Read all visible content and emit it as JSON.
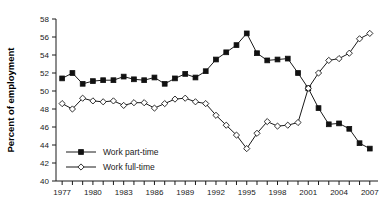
{
  "chart_data": {
    "type": "line",
    "title": "",
    "xlabel": "",
    "ylabel": "Percent of employment",
    "xlim": [
      1976.4,
      2007.8
    ],
    "ylim": [
      40,
      58
    ],
    "yticks": [
      40,
      42,
      44,
      46,
      48,
      50,
      52,
      54,
      56,
      58
    ],
    "xticks": [
      1977,
      1978,
      1979,
      1980,
      1981,
      1982,
      1983,
      1984,
      1985,
      1986,
      1987,
      1988,
      1989,
      1990,
      1991,
      1992,
      1993,
      1994,
      1995,
      1996,
      1997,
      1998,
      1999,
      2000,
      2001,
      2002,
      2003,
      2004,
      2005,
      2006,
      2007
    ],
    "xtick_labels": [
      "1977",
      "",
      "",
      "1980",
      "",
      "",
      "1983",
      "",
      "",
      "1986",
      "",
      "",
      "1989",
      "",
      "",
      "1992",
      "",
      "",
      "1995",
      "",
      "",
      "1998",
      "",
      "",
      "2001",
      "",
      "",
      "2004",
      "",
      "",
      "2007"
    ],
    "ytick_labels": [
      "40",
      "42",
      "44",
      "46",
      "48",
      "50",
      "52",
      "54",
      "56",
      "58"
    ],
    "grid": false,
    "legend_position": "lower-left",
    "x": [
      1977,
      1978,
      1979,
      1980,
      1981,
      1982,
      1983,
      1984,
      1985,
      1986,
      1987,
      1988,
      1989,
      1990,
      1991,
      1992,
      1993,
      1994,
      1995,
      1996,
      1997,
      1998,
      1999,
      2000,
      2001,
      2002,
      2003,
      2004,
      2005,
      2006,
      2007
    ],
    "series": [
      {
        "name": "Work part-time",
        "marker": "filled-square",
        "values": [
          51.4,
          52.0,
          50.8,
          51.1,
          51.2,
          51.2,
          51.6,
          51.3,
          51.2,
          51.5,
          50.8,
          51.4,
          51.9,
          51.5,
          52.2,
          53.5,
          54.3,
          55.1,
          56.4,
          54.2,
          53.4,
          53.5,
          53.6,
          52.0,
          50.3,
          48.1,
          46.3,
          46.4,
          45.8,
          44.2,
          43.6
        ]
      },
      {
        "name": "Work full-time",
        "marker": "open-diamond",
        "values": [
          48.6,
          48.0,
          49.2,
          48.9,
          48.8,
          48.9,
          48.4,
          48.7,
          48.7,
          48.1,
          48.6,
          49.1,
          49.2,
          48.8,
          48.6,
          47.3,
          46.2,
          45.1,
          43.6,
          45.3,
          46.6,
          46.1,
          46.2,
          46.5,
          50.3,
          52.0,
          53.4,
          53.6,
          54.2,
          55.8,
          56.4
        ]
      }
    ],
    "legend": [
      {
        "label": "Work part-time",
        "marker": "filled-square"
      },
      {
        "label": "Work full-time",
        "marker": "open-diamond"
      }
    ],
    "colors": {
      "axis": "#1a1a1a",
      "series_part_time": "#111111",
      "series_full_time": "#1a1a1a",
      "background": "#ffffff"
    }
  }
}
